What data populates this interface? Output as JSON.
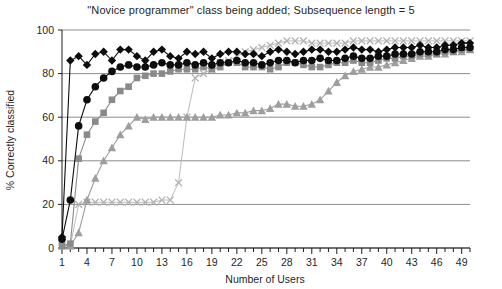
{
  "chart_data": {
    "type": "line",
    "title": "\"Novice programmer\" class being added; Subsequence length = 5",
    "xlabel": "Number of Users",
    "ylabel": "% Correctly classified",
    "xlim": [
      1,
      50
    ],
    "ylim": [
      0,
      100
    ],
    "grid": true,
    "legend": "none",
    "y_ticks": [
      0,
      20,
      40,
      60,
      80,
      100
    ],
    "x_ticks": [
      1,
      4,
      7,
      10,
      13,
      16,
      19,
      22,
      25,
      28,
      31,
      34,
      37,
      40,
      43,
      46,
      49
    ],
    "x_minor_step": 1,
    "x": [
      1,
      2,
      3,
      4,
      5,
      6,
      7,
      8,
      9,
      10,
      11,
      12,
      13,
      14,
      15,
      16,
      17,
      18,
      19,
      20,
      21,
      22,
      23,
      24,
      25,
      26,
      27,
      28,
      29,
      30,
      31,
      32,
      33,
      34,
      35,
      36,
      37,
      38,
      39,
      40,
      41,
      42,
      43,
      44,
      45,
      46,
      47,
      48,
      49,
      50
    ],
    "series": [
      {
        "name": "diamond-series",
        "marker": "diamond",
        "color": "#0d0d0d",
        "line_color": "#0d0d0d",
        "values": [
          5,
          86,
          88,
          84,
          89,
          90,
          86,
          91,
          91,
          88,
          86,
          90,
          91,
          88,
          87,
          90,
          89,
          90,
          87,
          89,
          90,
          90,
          89,
          89,
          88,
          90,
          91,
          90,
          89,
          90,
          91,
          91,
          90,
          90,
          91,
          92,
          91,
          91,
          90,
          91,
          92,
          92,
          92,
          93,
          92,
          92,
          93,
          93,
          94,
          94
        ]
      },
      {
        "name": "circle-series",
        "marker": "circle",
        "color": "#0d0d0d",
        "line_color": "#0d0d0d",
        "values": [
          4,
          22,
          56,
          68,
          74,
          78,
          81,
          83,
          84,
          83,
          83,
          84,
          85,
          84,
          84,
          85,
          84,
          85,
          84,
          85,
          85,
          86,
          85,
          85,
          84,
          85,
          86,
          86,
          85,
          86,
          86,
          87,
          86,
          86,
          87,
          88,
          87,
          87,
          88,
          88,
          89,
          89,
          89,
          90,
          90,
          90,
          91,
          91,
          92,
          92
        ]
      },
      {
        "name": "square-series",
        "marker": "square",
        "color": "#8a8a8a",
        "line_color": "#8a8a8a",
        "values": [
          1,
          2,
          41,
          52,
          58,
          62,
          68,
          72,
          74,
          78,
          79,
          80,
          80,
          81,
          82,
          82,
          82,
          83,
          82,
          83,
          85,
          85,
          83,
          83,
          83,
          82,
          83,
          85,
          85,
          84,
          83,
          83,
          84,
          85,
          85,
          86,
          85,
          85,
          86,
          87,
          87,
          88,
          88,
          89,
          89,
          89,
          90,
          90,
          91,
          91
        ]
      },
      {
        "name": "triangle-series",
        "marker": "triangle",
        "color": "#9e9e9e",
        "line_color": "#9e9e9e",
        "values": [
          1,
          1,
          7,
          22,
          32,
          40,
          46,
          52,
          56,
          60,
          59,
          60,
          60,
          60,
          60,
          60,
          60,
          60,
          60,
          61,
          61,
          62,
          62,
          63,
          63,
          64,
          66,
          66,
          65,
          65,
          66,
          68,
          72,
          76,
          79,
          81,
          82,
          83,
          83,
          84,
          85,
          86,
          87,
          88,
          88,
          89,
          89,
          90,
          90,
          91
        ]
      },
      {
        "name": "cross-series",
        "marker": "cross",
        "color": "#b3b3b3",
        "line_color": "#b3b3b3",
        "values": [
          1,
          1,
          20,
          21,
          21,
          21,
          21,
          21,
          21,
          21,
          21,
          21,
          22,
          22,
          30,
          60,
          78,
          80,
          82,
          85,
          86,
          88,
          90,
          91,
          92,
          93,
          94,
          95,
          95,
          95,
          94,
          94,
          94,
          94,
          94,
          95,
          95,
          95,
          95,
          95,
          95,
          95,
          95,
          95,
          95,
          95,
          95,
          95,
          95,
          95
        ]
      }
    ]
  }
}
